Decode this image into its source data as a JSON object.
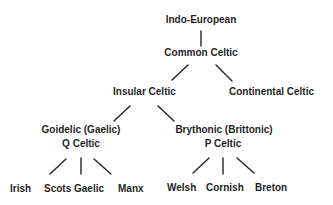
{
  "diagram": {
    "type": "tree",
    "nodes": {
      "root": "Indo-European",
      "common": "Common Celtic",
      "insular": "Insular Celtic",
      "continental": "Continental Celtic",
      "goidelic": "Goidelic (Gaelic)",
      "goidelic_sub": "Q Celtic",
      "brythonic": "Brythonic (Brittonic)",
      "brythonic_sub": "P Celtic",
      "irish": "Irish",
      "scots_gaelic": "Scots Gaelic",
      "manx": "Manx",
      "welsh": "Welsh",
      "cornish": "Cornish",
      "breton": "Breton"
    },
    "edges": [
      [
        "Indo-European",
        "Common Celtic"
      ],
      [
        "Common Celtic",
        "Insular Celtic"
      ],
      [
        "Common Celtic",
        "Continental Celtic"
      ],
      [
        "Insular Celtic",
        "Goidelic (Gaelic)"
      ],
      [
        "Insular Celtic",
        "Brythonic (Brittonic)"
      ],
      [
        "Goidelic (Gaelic)",
        "Irish"
      ],
      [
        "Goidelic (Gaelic)",
        "Scots Gaelic"
      ],
      [
        "Goidelic (Gaelic)",
        "Manx"
      ],
      [
        "Brythonic (Brittonic)",
        "Welsh"
      ],
      [
        "Brythonic (Brittonic)",
        "Cornish"
      ],
      [
        "Brythonic (Brittonic)",
        "Breton"
      ]
    ]
  }
}
